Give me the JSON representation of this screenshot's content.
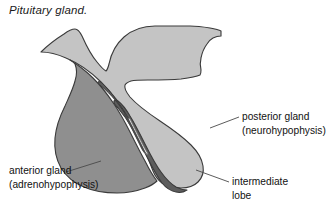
{
  "figure": {
    "caption": "Pituitary gland.",
    "type": "anatomical-illustration"
  },
  "labels": [
    {
      "id": "posterior",
      "line1": "posterior gland",
      "line2": "(neurohypophysis)",
      "target": "posterior-gland-region"
    },
    {
      "id": "anterior",
      "line1": "anterior gland",
      "line2": "(adrenohypophysis)",
      "target": "anterior-gland-region"
    },
    {
      "id": "intermediate",
      "line1": "intermediate",
      "line2": "lobe",
      "target": "intermediate-lobe-region"
    }
  ],
  "regions": [
    {
      "id": "hypothalamus-posterior",
      "name": "posterior gland",
      "fill": "#c4c4c4",
      "stroke": "#3a3a3a"
    },
    {
      "id": "anterior-gland",
      "name": "anterior gland",
      "fill": "#8f8f8f",
      "stroke": "#3a3a3a"
    },
    {
      "id": "intermediate-lobe",
      "name": "intermediate lobe",
      "fill": "#5d5d5d",
      "stroke": "#3a3a3a"
    },
    {
      "id": "cleft",
      "name": "hypophyseal cleft",
      "fill": "#ffffff",
      "stroke": "#3a3a3a"
    }
  ],
  "colors": {
    "light_gray": "#c4c4c4",
    "medium_gray": "#8f8f8f",
    "dark_gray": "#5d5d5d",
    "outline": "#3a3a3a",
    "leader_line": "#4a4a4a",
    "text": "#111111",
    "background": "#ffffff"
  }
}
